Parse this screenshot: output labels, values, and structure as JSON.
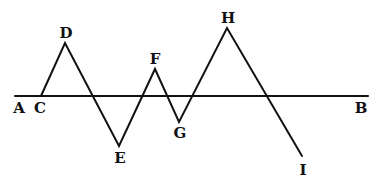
{
  "diagram": {
    "baseline": {
      "from": "A",
      "to": "B",
      "x1": 15,
      "y1": 96,
      "x2": 368,
      "y2": 96
    },
    "points": {
      "C": {
        "x": 41,
        "y": 96
      },
      "D": {
        "x": 65,
        "y": 43
      },
      "E": {
        "x": 119,
        "y": 146
      },
      "F": {
        "x": 155,
        "y": 69
      },
      "G": {
        "x": 179,
        "y": 122
      },
      "H": {
        "x": 227,
        "y": 28
      },
      "I": {
        "x": 302,
        "y": 156
      }
    },
    "path_order": [
      "C",
      "D",
      "E",
      "F",
      "G",
      "H",
      "I"
    ],
    "labels": {
      "A": {
        "text": "A",
        "x": 19,
        "y": 113
      },
      "C": {
        "text": "C",
        "x": 40,
        "y": 113
      },
      "D": {
        "text": "D",
        "x": 66,
        "y": 38
      },
      "E": {
        "text": "E",
        "x": 120,
        "y": 163
      },
      "F": {
        "text": "F",
        "x": 155,
        "y": 64
      },
      "G": {
        "text": "G",
        "x": 180,
        "y": 138
      },
      "H": {
        "text": "H",
        "x": 228,
        "y": 23
      },
      "I": {
        "text": "I",
        "x": 303,
        "y": 175
      },
      "B": {
        "text": "B",
        "x": 361,
        "y": 113
      }
    },
    "stroke_color": "#111111",
    "background": "#ffffff"
  }
}
